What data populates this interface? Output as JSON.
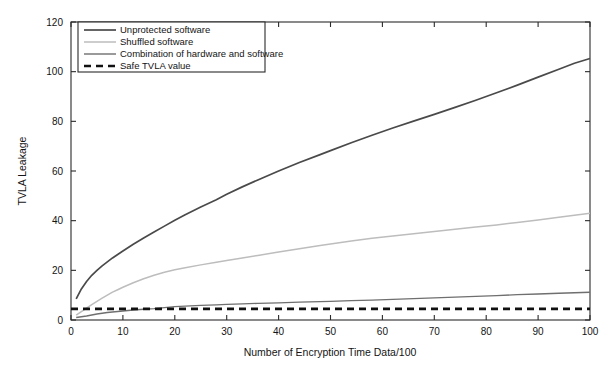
{
  "chart_data": {
    "type": "line",
    "title": "",
    "xlabel": "Number of Encryption Time Data/100",
    "ylabel": "TVLA Leakage",
    "xlim": [
      0,
      100
    ],
    "ylim": [
      0,
      120
    ],
    "xticks": [
      0,
      10,
      20,
      30,
      40,
      50,
      60,
      70,
      80,
      90,
      100
    ],
    "yticks": [
      0,
      20,
      40,
      60,
      80,
      100,
      120
    ],
    "xtick_labels": [
      "0",
      "10",
      "20",
      "30",
      "40",
      "50",
      "60",
      "70",
      "80",
      "90",
      "100"
    ],
    "ytick_labels": [
      "0",
      "20",
      "40",
      "60",
      "80",
      "100",
      "120"
    ],
    "grid": false,
    "legend_position": "top-left",
    "x": [
      1,
      2,
      3,
      4,
      5,
      6,
      7,
      8,
      9,
      10,
      12,
      14,
      16,
      18,
      20,
      22,
      25,
      28,
      30,
      33,
      36,
      40,
      44,
      48,
      50,
      54,
      58,
      62,
      66,
      70,
      74,
      78,
      82,
      86,
      90,
      94,
      97,
      100
    ],
    "series": [
      {
        "name": "Unprotected software",
        "color": "#4a4a4a",
        "width": 1.7,
        "dash": "none",
        "values": [
          8.5,
          12.5,
          15.5,
          18.0,
          20.0,
          21.8,
          23.4,
          25.0,
          26.4,
          27.8,
          30.5,
          33.0,
          35.4,
          37.8,
          40.2,
          42.4,
          45.5,
          48.4,
          50.6,
          53.6,
          56.4,
          60.0,
          63.4,
          66.6,
          68.2,
          71.4,
          74.4,
          77.3,
          80.1,
          82.8,
          85.6,
          88.5,
          91.5,
          94.6,
          97.8,
          101.0,
          103.4,
          105.3
        ]
      },
      {
        "name": "Shuffled software",
        "color": "#bdbdbd",
        "width": 1.5,
        "dash": "none",
        "values": [
          2.0,
          3.4,
          4.8,
          6.2,
          7.5,
          8.8,
          10.0,
          11.2,
          12.2,
          13.2,
          15.0,
          16.6,
          18.0,
          19.2,
          20.2,
          21.0,
          22.2,
          23.3,
          24.0,
          25.0,
          26.0,
          27.4,
          28.7,
          30.0,
          30.6,
          31.8,
          32.9,
          33.8,
          34.7,
          35.6,
          36.5,
          37.4,
          38.3,
          39.3,
          40.3,
          41.4,
          42.2,
          43.0
        ]
      },
      {
        "name": "Combination of hardware and software",
        "color": "#6f6f6f",
        "width": 1.4,
        "dash": "none",
        "values": [
          1.0,
          1.3,
          1.6,
          2.0,
          2.4,
          2.7,
          3.0,
          3.2,
          3.4,
          3.6,
          4.0,
          4.3,
          4.6,
          5.0,
          5.4,
          5.6,
          5.9,
          6.1,
          6.3,
          6.5,
          6.7,
          6.9,
          7.2,
          7.4,
          7.5,
          7.8,
          8.0,
          8.3,
          8.6,
          8.9,
          9.2,
          9.5,
          9.8,
          10.2,
          10.5,
          10.8,
          11.0,
          11.2
        ]
      },
      {
        "name": "Safe TVLA value",
        "color": "#111111",
        "width": 2.6,
        "dash": "7 5",
        "constant": 4.5,
        "values": [
          4.5,
          4.5,
          4.5,
          4.5,
          4.5,
          4.5,
          4.5,
          4.5,
          4.5,
          4.5,
          4.5,
          4.5,
          4.5,
          4.5,
          4.5,
          4.5,
          4.5,
          4.5,
          4.5,
          4.5,
          4.5,
          4.5,
          4.5,
          4.5,
          4.5,
          4.5,
          4.5,
          4.5,
          4.5,
          4.5,
          4.5,
          4.5,
          4.5,
          4.5,
          4.5,
          4.5,
          4.5,
          4.5
        ]
      }
    ],
    "legend": [
      "Unprotected software",
      "Shuffled software",
      "Combination of hardware and software",
      "Safe TVLA value"
    ]
  }
}
